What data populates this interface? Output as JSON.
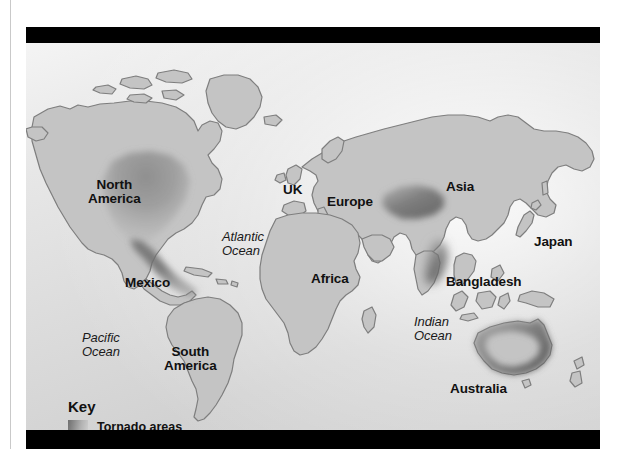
{
  "figure": {
    "kind": "world-map",
    "ocean_fill": "#dcdcdc",
    "land_fill": "#c4c4c4",
    "land_outline": "#7e7e7e",
    "tornado_shading": "#6e6e6e",
    "bar_color": "#000000"
  },
  "labels": {
    "land": [
      {
        "id": "north-america",
        "text_line1": "North",
        "text_line2": "America",
        "x": 62,
        "y": 135
      },
      {
        "id": "mexico",
        "text_line1": "Mexico",
        "text_line2": "",
        "x": 99,
        "y": 233
      },
      {
        "id": "south-america",
        "text_line1": "South",
        "text_line2": "America",
        "x": 138,
        "y": 302
      },
      {
        "id": "uk",
        "text_line1": "UK",
        "text_line2": "",
        "x": 257,
        "y": 140
      },
      {
        "id": "europe",
        "text_line1": "Europe",
        "text_line2": "",
        "x": 301,
        "y": 152
      },
      {
        "id": "africa",
        "text_line1": "Africa",
        "text_line2": "",
        "x": 285,
        "y": 229
      },
      {
        "id": "asia",
        "text_line1": "Asia",
        "text_line2": "",
        "x": 420,
        "y": 137
      },
      {
        "id": "japan",
        "text_line1": "Japan",
        "text_line2": "",
        "x": 508,
        "y": 192
      },
      {
        "id": "bangladesh",
        "text_line1": "Bangladesh",
        "text_line2": "",
        "x": 420,
        "y": 232
      },
      {
        "id": "australia",
        "text_line1": "Australia",
        "text_line2": "",
        "x": 424,
        "y": 339
      }
    ],
    "ocean": [
      {
        "id": "pacific-ocean",
        "text_line1": "Pacific",
        "text_line2": "Ocean",
        "x": 56,
        "y": 288
      },
      {
        "id": "atlantic-ocean",
        "text_line1": "Atlantic",
        "text_line2": "Ocean",
        "x": 196,
        "y": 187
      },
      {
        "id": "indian-ocean",
        "text_line1": "Indian",
        "text_line2": "Ocean",
        "x": 388,
        "y": 272
      }
    ]
  },
  "key": {
    "title": "Key",
    "entries": [
      {
        "id": "tornado-areas",
        "label": "Tornado areas",
        "swatch": "gradient-dark-to-light-gray"
      }
    ]
  },
  "tornado_regions": [
    {
      "id": "north-america-tornado-alley",
      "region": "North America",
      "note": "central USA into Gulf of Mexico"
    },
    {
      "id": "central-asia-tornado",
      "region": "Asia",
      "note": "central Asian band"
    },
    {
      "id": "bangladesh-tornado",
      "region": "Bangladesh",
      "note": "Bay of Bengal / Bangladesh"
    },
    {
      "id": "australia-tornado",
      "region": "Australia",
      "note": "coastal fringe"
    }
  ]
}
